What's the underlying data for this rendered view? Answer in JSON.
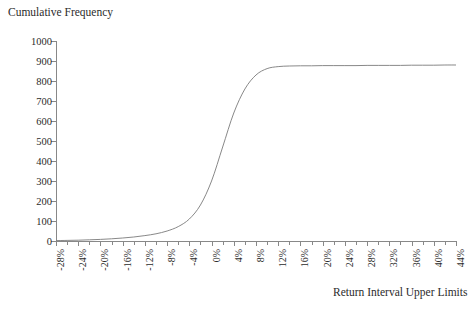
{
  "chart_data": {
    "type": "line",
    "title": "",
    "ylabel": "Cumulative Frequency",
    "xlabel": "Return Interval Upper Limits",
    "xlim": [
      -28,
      44
    ],
    "ylim": [
      0,
      1000
    ],
    "grid": false,
    "legend": null,
    "y_ticks": [
      0,
      100,
      200,
      300,
      400,
      500,
      600,
      700,
      800,
      900,
      1000
    ],
    "y_tick_labels": [
      "0",
      "100",
      "200",
      "300",
      "400",
      "500",
      "600",
      "700",
      "800",
      "900",
      "1000"
    ],
    "x_ticks": [
      -28,
      -24,
      -20,
      -16,
      -12,
      -8,
      -4,
      0,
      4,
      8,
      12,
      16,
      20,
      24,
      28,
      32,
      36,
      40,
      44
    ],
    "x_tick_labels": [
      "-28%",
      "-24%",
      "-20%",
      "-16%",
      "-12%",
      "-8%",
      "-4%",
      "0%",
      "4%",
      "8%",
      "12%",
      "16%",
      "20%",
      "24%",
      "28%",
      "32%",
      "36%",
      "40%",
      "44%"
    ],
    "x_minor_step": 2,
    "series": [
      {
        "name": "Cumulative Frequency",
        "color": "#7a7a7a",
        "x": [
          -28,
          -26,
          -24,
          -22,
          -20,
          -18,
          -16,
          -14,
          -12,
          -10,
          -8,
          -6,
          -4,
          -2,
          0,
          2,
          4,
          6,
          8,
          10,
          12,
          14,
          16,
          18,
          20,
          22,
          24,
          26,
          28,
          30,
          32,
          34,
          36,
          38,
          40,
          42,
          44
        ],
        "values": [
          2,
          3,
          4,
          6,
          8,
          11,
          15,
          20,
          27,
          36,
          50,
          72,
          110,
          180,
          300,
          470,
          640,
          760,
          830,
          862,
          872,
          875,
          876,
          876,
          877,
          877,
          877,
          877,
          878,
          878,
          878,
          878,
          879,
          879,
          879,
          880,
          880
        ]
      }
    ]
  },
  "axis": {
    "y_title": "Cumulative Frequency",
    "x_title": "Return Interval Upper Limits"
  },
  "style": {
    "axis_color": "#888888",
    "curve_color": "#7a7a7a",
    "text_color": "#2b2b2b",
    "background": "#ffffff"
  }
}
